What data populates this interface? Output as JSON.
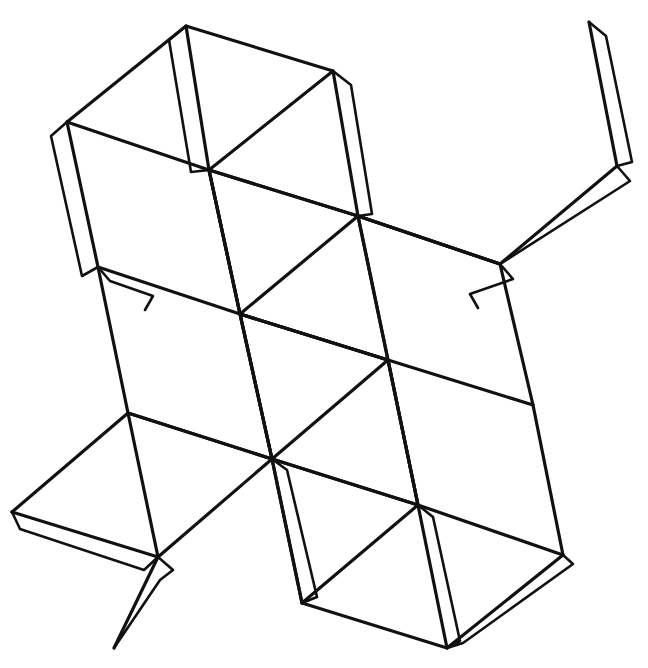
{
  "document": {
    "title": "Polyhedron Net Template",
    "kind": "line-drawing",
    "width": 648,
    "height": 668,
    "background_color": "#ffffff",
    "stroke_color": "#111111",
    "stroke_width_main": 3.2,
    "stroke_width_tab": 2.6
  },
  "figure": {
    "name": "polyhedron-net",
    "lattice": {
      "comment": "Core grid vertices where diagonals cross, in image pixel coordinates.",
      "points": {
        "c_tl": [
          209,
          170
        ],
        "c_tr": [
          358,
          216
        ],
        "c_ml": [
          240,
          314
        ],
        "c_mr": [
          388,
          360
        ],
        "c_bl": [
          272,
          459
        ],
        "c_br": [
          418,
          505
        ]
      }
    },
    "outline_vertices": {
      "comment": "Outer silhouette corner points in image pixel coordinates.",
      "top_wing_apex": [
        186,
        26
      ],
      "top_wing_right": [
        333,
        71
      ],
      "upper_left_corner": [
        67,
        122
      ],
      "left_wing_low": [
        98,
        267
      ],
      "top_right_apex": [
        589,
        22
      ],
      "right_vertex": [
        617,
        166
      ],
      "right_wing_low": [
        500,
        264
      ],
      "left_corner": [
        12,
        512
      ],
      "lower_left_vertex": [
        158,
        557
      ],
      "lower_left_top": [
        128,
        413
      ],
      "bottom_left_corner": [
        114,
        648
      ],
      "bottom_mid_left": [
        302,
        603
      ],
      "bottom_mid_right": [
        447,
        648
      ],
      "bottom_right_vertex": [
        563,
        555
      ],
      "right_low_top": [
        533,
        405
      ]
    },
    "paths": {
      "comment": "All stroked polyline paths of the drawing as SVG path data strings.",
      "body_outline": "M 186 26 L 333 71 L 358 216 L 500 264 L 533 405 L 563 555 L 447 648 L 302 603 L 272 459 L 128 413 L 98 267 L 67 122 Z",
      "grid_edge_top_left": "M 209 170 L 358 216",
      "grid_edge_mid": "M 240 314 L 388 360",
      "grid_edge_bottom": "M 272 459 L 418 505",
      "grid_col_left": "M 209 170 L 240 314 L 272 459",
      "grid_col_right": "M 358 216 L 388 360 L 418 505",
      "long_diag_main": "M 186 26 L 209 170 L 240 314 L 272 459 L 302 603",
      "long_diag_main_right": "M 358 216 L 388 360 L 418 505 L 447 648",
      "diag_a": "M 67 122 L 209 170 L 333 71",
      "diag_b": "M 98 267 L 240 314 L 209 170",
      "diag_c": "M 358 216 L 240 314 L 388 360",
      "diag_d": "M 209 170 L 358 216 L 500 264",
      "diag_e": "M 128 413 L 272 459 L 240 314",
      "diag_f": "M 388 360 L 272 459 L 418 505",
      "diag_g": "M 240 314 L 388 360 L 533 405",
      "diag_h": "M 12 512 L 158 557 L 128 413",
      "diag_i": "M 272 459 L 158 557",
      "diag_j": "M 418 505 L 302 603",
      "diag_k": "M 388 360 L 418 505 L 563 555",
      "diag_l": "M 158 557 L 114 648",
      "diag_m": "M 12 512 L 128 413",
      "diag_n": "M 500 264 L 358 216",
      "diag_o": "M 589 22 L 617 166 L 500 264",
      "diag_p": "M 500 264 L 589 22",
      "diag_q": "M 617 166 L 500 264",
      "tab_top_left": "M 186 26 L 169 40 L 191 172 L 209 170",
      "tab_top_right": "M 333 71 L 351 85 L 372 214 L 358 216",
      "tab_upper_left": "M 67 122 L 51 136 L 82 276 L 98 267",
      "tab_left_lower": "M 98 267 L 110 281 L 153 296 L 145 310",
      "tab_right_upper": "M 589 22 L 606 36 L 632 162 L 617 166",
      "tab_right_mid": "M 617 166 L 630 181 L 616 190 L 500 264",
      "tab_right_inner": "M 500 264 L 513 279 L 470 294 L 478 308",
      "tab_bottom_left_low": "M 12 512 L 20 529 L 144 570 L 158 557",
      "tab_bottom_mid": "M 158 557 L 173 570 L 160 580 L 114 648",
      "tab_lower_inner": "M 272 459 L 287 470 L 317 597 L 302 603",
      "tab_bottom_right": "M 418 505 L 433 517 L 460 641 L 447 648",
      "tab_bottom_right_edge": "M 447 648 L 463 643 L 573 564 L 563 555"
    }
  },
  "toolbar": {
    "visible": false
  }
}
